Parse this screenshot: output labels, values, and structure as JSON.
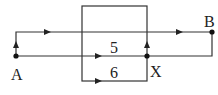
{
  "diagram": {
    "type": "circuit-path-diagram",
    "stroke_color": "#333333",
    "background": "#ffffff",
    "labels": {
      "a": "A",
      "b": "B",
      "x": "X",
      "five": "5",
      "six": "6"
    },
    "nodes": [
      {
        "id": "A",
        "x": 16,
        "y": 56
      },
      {
        "id": "X",
        "x": 147,
        "y": 56
      },
      {
        "id": "B",
        "x": 212,
        "y": 32
      }
    ],
    "box": {
      "left": 82,
      "top": 6,
      "right": 147,
      "bottom": 81
    },
    "lines": [
      {
        "name": "top-path",
        "y": 32,
        "from_x": 16,
        "to_x": 212
      },
      {
        "name": "middle-path",
        "y": 56,
        "from_x": 16,
        "to_x": 212
      },
      {
        "name": "bottom-path",
        "y": 81,
        "from_x": 82,
        "to_x": 147
      }
    ]
  }
}
